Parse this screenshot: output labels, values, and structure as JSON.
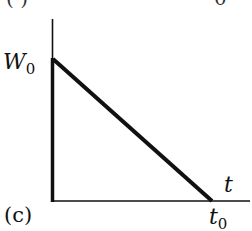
{
  "figure": {
    "panel_label": "(c)",
    "y_label_main": "W",
    "y_label_sub": "0",
    "x_label": "t",
    "x_tick_main": "t",
    "x_tick_sub": "0",
    "top_fragments": [
      "( )",
      "0"
    ]
  },
  "diagram": {
    "type": "line_graph_sketch",
    "points": [
      [
        "0",
        "W0"
      ],
      [
        "t0",
        "0"
      ]
    ],
    "axes": {
      "x": "t",
      "y": "W"
    },
    "line_color": "#111111",
    "axis_color": "#111111"
  }
}
